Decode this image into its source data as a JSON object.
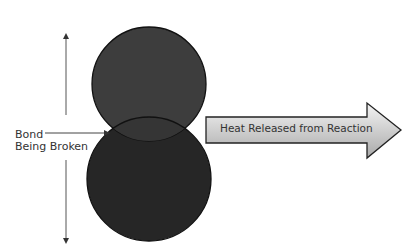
{
  "diagram": {
    "bond_label_line1": "Bond",
    "bond_label_line2": "Being Broken",
    "heat_arrow_label": "Heat Released from Reaction",
    "colors": {
      "top_atom": "#3d3d3d",
      "bottom_atom": "#262626",
      "outline": "#111111",
      "arrow_light": "#f2f2f2",
      "arrow_dark": "#a8a8a8"
    }
  }
}
